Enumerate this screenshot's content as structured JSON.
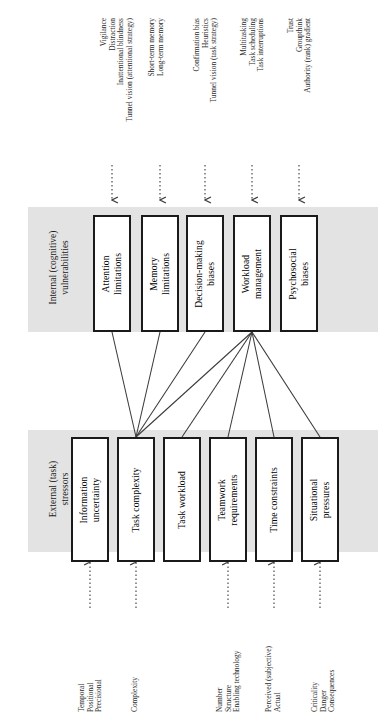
{
  "diagram": {
    "orientation": "rotated-90",
    "bands": [
      {
        "id": "internal",
        "label": "Internal (cognitive)\nvulnerabilities",
        "fill": "#e3e3e3"
      },
      {
        "id": "external",
        "label": "External (task)\nstressors",
        "fill": "#e3e3e3"
      }
    ],
    "internal_nodes": [
      {
        "id": "attention",
        "label": "Attention\nlimitations",
        "inputs": "Vigilance\nDistraction\nInattentional blindness\nTunnel vision (attentional strategy)"
      },
      {
        "id": "memory",
        "label": "Memory\nlimitations",
        "inputs": "Short-term memory\nLong-term memory"
      },
      {
        "id": "decision",
        "label": "Decision-making\nbiases",
        "inputs": "Confirmation bias\nHeuristics\nTunnel vision (task strategy)"
      },
      {
        "id": "workload",
        "label": "Workload\nmanagement",
        "inputs": "Multitasking\nTask scheduling\nTask interruptions"
      },
      {
        "id": "psychosocial",
        "label": "Psychosocial\nbiases",
        "inputs": "Trust\nGroupthink\nAuthority (rank) gradient"
      }
    ],
    "external_nodes": [
      {
        "id": "information",
        "label": "Information\nuncertainty",
        "inputs": "Temporal\nPositional\nPrecisional"
      },
      {
        "id": "complexity",
        "label": "Task complexity",
        "inputs": "Complexity"
      },
      {
        "id": "taskload",
        "label": "Task workload",
        "inputs": ""
      },
      {
        "id": "teamwork",
        "label": "Teamwork\nrequirements",
        "inputs": "Number\nStructure\nEnabling technology"
      },
      {
        "id": "time",
        "label": "Time constraints",
        "inputs": "Perceived (subjective)\nActual"
      },
      {
        "id": "situational",
        "label": "Situational\npressures",
        "inputs": "Criticality\nDanger\nConsequences"
      }
    ],
    "colors": {
      "band_fill": "#e3e3e3",
      "node_border": "#1a1a1a",
      "node_fill": "#ffffff",
      "connector": "#3a3a3a",
      "text": "#000000"
    }
  }
}
